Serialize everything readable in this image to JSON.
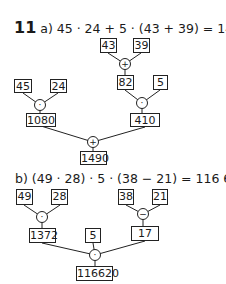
{
  "exercise_number": "11",
  "part_a": {
    "label": "a)",
    "equation": "45 · 24 + 5 · (43 + 39) = 1490",
    "tree": {
      "left_a": "45",
      "left_b": "24",
      "left_op": "·",
      "left_result": "1080",
      "top_a": "43",
      "top_b": "39",
      "top_op": "+",
      "top_result": "82",
      "right_b": "5",
      "right_op": "·",
      "right_result": "410",
      "final_op": "+",
      "final_result": "1490"
    }
  },
  "part_b": {
    "label": "b)",
    "equation": "(49 · 28) · 5 · (38 − 21) = 116 620",
    "tree": {
      "left_a": "49",
      "left_b": "28",
      "left_op": "·",
      "left_result": "1372",
      "right_a": "38",
      "right_b": "21",
      "right_op": "−",
      "right_result": "17",
      "middle": "5",
      "final_op": "·",
      "final_result": "116620"
    }
  }
}
